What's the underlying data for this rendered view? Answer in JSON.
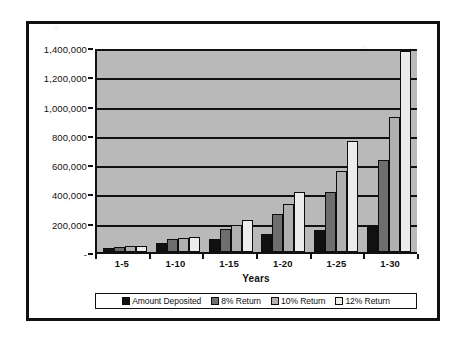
{
  "chart_data": {
    "type": "bar",
    "title": "",
    "subtitle": "",
    "xlabel": "Years",
    "ylabel": "",
    "categories": [
      "1-5",
      "1-10",
      "1-15",
      "1-20",
      "1-25",
      "1-30"
    ],
    "series": [
      {
        "name": "Amount Deposited",
        "color": "#111111",
        "values": [
          30000,
          60000,
          90000,
          120000,
          150000,
          180000
        ]
      },
      {
        "name": "8% Return",
        "color": "#6e6e6e",
        "values": [
          36000,
          88000,
          160000,
          262000,
          410000,
          625000
        ]
      },
      {
        "name": "10% Return",
        "color": "#b0b0b0",
        "values": [
          38000,
          96000,
          185000,
          325000,
          555000,
          920000
        ]
      },
      {
        "name": "12% Return",
        "color": "#ececec",
        "values": [
          40000,
          105000,
          217000,
          410000,
          760000,
          1370000
        ]
      }
    ],
    "ylim": [
      0,
      1400000
    ],
    "ytick_values": [
      1400000,
      1200000,
      1000000,
      800000,
      600000,
      400000,
      200000,
      0
    ],
    "ytick_labels": [
      "1,400,000",
      "1,200,000",
      "1,000,000",
      "800,000",
      "600,000",
      "400,000",
      "200,000",
      "-"
    ],
    "grid": true,
    "grid_axis": "y",
    "legend_position": "bottom",
    "plot_background": "#b9b9b9",
    "frame_color": "#111111"
  },
  "legend": {
    "items": [
      {
        "label": "Amount Deposited",
        "swatch_class": "s0"
      },
      {
        "label": "8% Return",
        "swatch_class": "s1"
      },
      {
        "label": "10% Return",
        "swatch_class": "s2"
      },
      {
        "label": "12% Return",
        "swatch_class": "s3"
      }
    ]
  }
}
